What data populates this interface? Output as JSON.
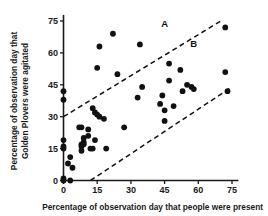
{
  "chart_data": {
    "type": "scatter",
    "title": "",
    "xlabel": "Percentage of observation day that people were present",
    "ylabel_line1": "Percentage of observation day that",
    "ylabel_line2": "Golden Plovers were agitated",
    "xlim": [
      0,
      77
    ],
    "ylim": [
      0,
      77
    ],
    "xticks": [
      0,
      15,
      30,
      45,
      60,
      75
    ],
    "yticks": [
      0,
      15,
      30,
      45,
      60,
      75
    ],
    "xtick_labels": [
      "0",
      "15",
      "30",
      "45",
      "60",
      "75"
    ],
    "ytick_labels": [
      "0",
      "15",
      "30",
      "45",
      "60",
      "75"
    ],
    "grid": false,
    "legend": "none",
    "points": [
      [
        0,
        42
      ],
      [
        0,
        38
      ],
      [
        0,
        19
      ],
      [
        0,
        16
      ],
      [
        0,
        15
      ],
      [
        0,
        1
      ],
      [
        0,
        0
      ],
      [
        2,
        8
      ],
      [
        3,
        0
      ],
      [
        3,
        11
      ],
      [
        4,
        6
      ],
      [
        7,
        25
      ],
      [
        8,
        25
      ],
      [
        8,
        17
      ],
      [
        8,
        16
      ],
      [
        8,
        14
      ],
      [
        9,
        20
      ],
      [
        9,
        18
      ],
      [
        9,
        17
      ],
      [
        11,
        24
      ],
      [
        11,
        21
      ],
      [
        12,
        15
      ],
      [
        13,
        15
      ],
      [
        13,
        34
      ],
      [
        14,
        32
      ],
      [
        14,
        19
      ],
      [
        15,
        31
      ],
      [
        15,
        53
      ],
      [
        16,
        63
      ],
      [
        16,
        30
      ],
      [
        18,
        29
      ],
      [
        19,
        15
      ],
      [
        22,
        69
      ],
      [
        24,
        50
      ],
      [
        27,
        25
      ],
      [
        33,
        39
      ],
      [
        34,
        64
      ],
      [
        35,
        44
      ],
      [
        43,
        36
      ],
      [
        44,
        40
      ],
      [
        45,
        28
      ],
      [
        45,
        33
      ],
      [
        47,
        55
      ],
      [
        47,
        47
      ],
      [
        49,
        35
      ],
      [
        52,
        52
      ],
      [
        53,
        42
      ],
      [
        55,
        45
      ],
      [
        57,
        44
      ],
      [
        58,
        43
      ],
      [
        72,
        72
      ],
      [
        72,
        51
      ],
      [
        73,
        42
      ]
    ],
    "annotations": [
      {
        "text": "A",
        "x": 45,
        "y": 72
      },
      {
        "text": "B",
        "x": 58,
        "y": 63
      }
    ],
    "reference_lines": [
      {
        "name": "upper-boundary",
        "x1": 0,
        "y1": 30,
        "x2": 70,
        "y2": 75,
        "style": "dashed"
      },
      {
        "name": "lower-boundary",
        "x1": 12,
        "y1": 0,
        "x2": 75,
        "y2": 44,
        "style": "dashed"
      }
    ]
  }
}
